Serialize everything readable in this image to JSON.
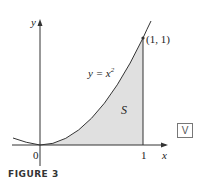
{
  "figure": {
    "caption": "FIGURE 3",
    "axis_x_label": "x",
    "axis_y_label": "y",
    "origin_label": "0",
    "tick_x_label": "1",
    "curve_label_prefix": "y = x",
    "curve_label_exp": "2",
    "point_label": "(1, 1)",
    "region_label": "S",
    "badge_label": "V",
    "colors": {
      "region_fill": "#e0e0e0",
      "line": "#333333"
    }
  }
}
